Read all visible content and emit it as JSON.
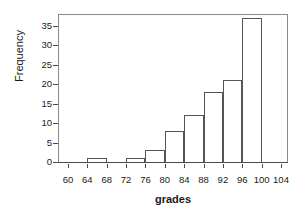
{
  "chart_data": {
    "type": "bar",
    "title": "",
    "xlabel": "grades",
    "ylabel": "Frequency",
    "categories": [
      "60-64",
      "64-68",
      "68-72",
      "72-76",
      "76-80",
      "80-84",
      "84-88",
      "88-92",
      "92-96",
      "96-100",
      "100-104"
    ],
    "bin_starts": [
      60,
      64,
      68,
      72,
      76,
      80,
      84,
      88,
      92,
      96,
      100
    ],
    "bin_width": 4,
    "values": [
      0,
      1,
      0,
      1,
      3,
      8,
      12,
      18,
      21,
      37,
      0
    ],
    "xlim": [
      58,
      106
    ],
    "ylim": [
      0,
      37
    ],
    "xticks": [
      60,
      64,
      68,
      72,
      76,
      80,
      84,
      88,
      92,
      96,
      100,
      104
    ],
    "yticks": [
      0,
      5,
      10,
      15,
      20,
      25,
      30,
      35
    ],
    "xtick_labels": [
      "60",
      "64",
      "68",
      "72",
      "76",
      "80",
      "84",
      "88",
      "92",
      "96",
      "100",
      "104"
    ],
    "ytick_labels": [
      "0",
      "5",
      "10",
      "15",
      "20",
      "25",
      "30",
      "35"
    ],
    "grid": false,
    "legend": null,
    "bar_edge_color": "#555555",
    "bar_fill_color": "#ffffff",
    "axis_color": "#4a4a4a",
    "text_color": "#1a1a1a"
  }
}
